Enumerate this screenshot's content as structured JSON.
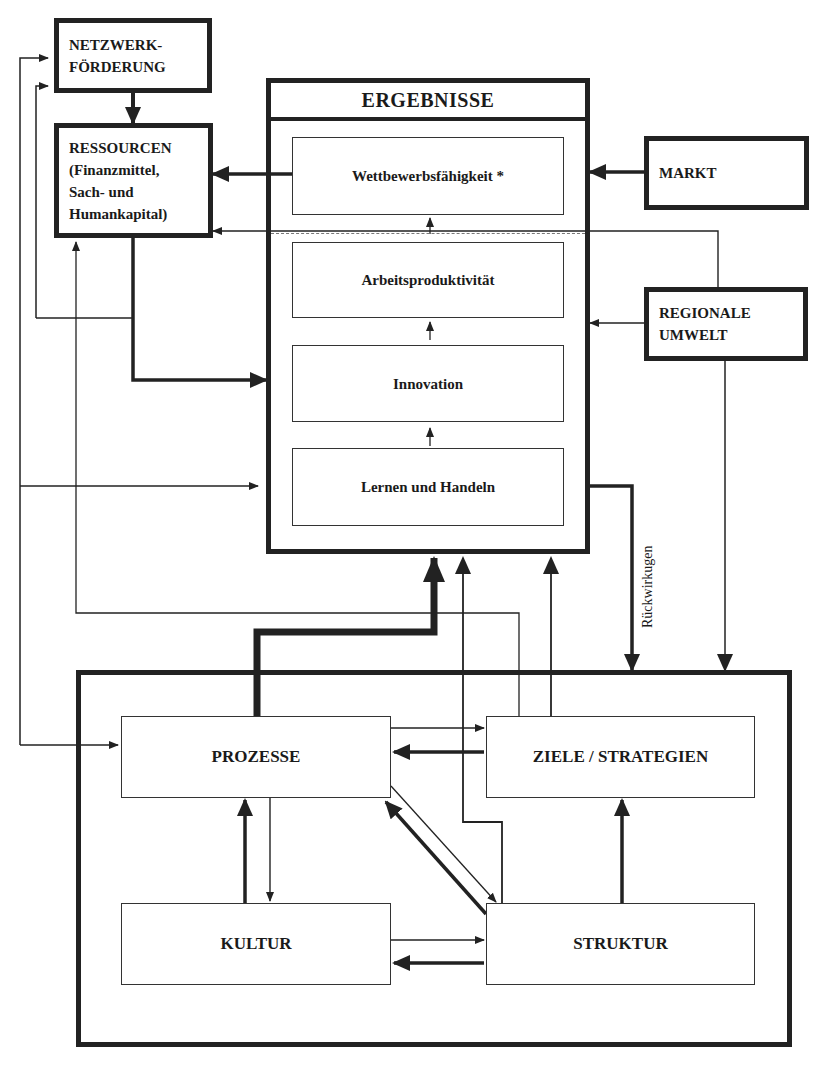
{
  "diagram": {
    "external": {
      "netzwerk": [
        "NETZWERK-",
        "FÖRDERUNG"
      ],
      "ressourcen": [
        "RESSOURCEN",
        "(Finanzmittel,",
        "Sach- und",
        "Humankapital)"
      ],
      "markt": "MARKT",
      "regionale_umwelt": [
        "REGIONALE",
        "UMWELT"
      ]
    },
    "ergebnisse": {
      "title": "ERGEBNISSE",
      "levels": [
        "Wettbewerbsfähigkeit *",
        "Arbeitsproduktivität",
        "Innovation",
        "Lernen und Handeln"
      ]
    },
    "feedback_label": "Rückwirkugen",
    "organisation": {
      "prozesse": "PROZESSE",
      "ziele": "ZIELE / STRATEGIEN",
      "kultur": "KULTUR",
      "struktur": "STRUKTUR"
    },
    "colors": {
      "line": "#222222",
      "background": "#ffffff"
    }
  }
}
